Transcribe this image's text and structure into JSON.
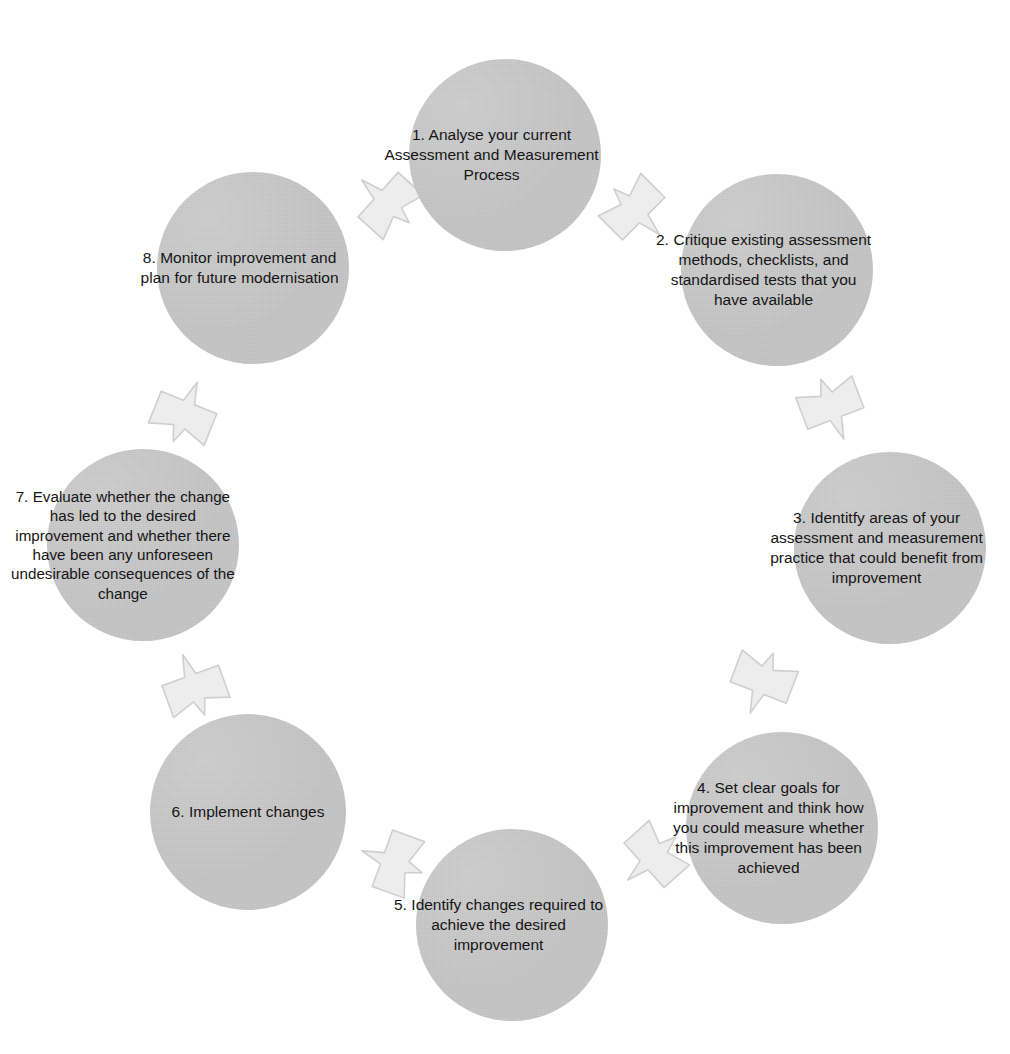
{
  "diagram": {
    "type": "cyclical-process",
    "direction": "clockwise",
    "step_count": 8,
    "colors": {
      "circle_fill": "#c6c6c6",
      "arrow_fill": "#ededed",
      "arrow_stroke": "#c9c9c9",
      "text": "#151515",
      "background": "#ffffff"
    },
    "steps": [
      {
        "number": "1",
        "label": "1. Analyse your current Assessment and Measurement Process",
        "position": {
          "x": 505,
          "y": 155
        },
        "diameter": 192
      },
      {
        "number": "2",
        "label": "2. Critique existing assessment methods, checklists, and standardised tests that you have available",
        "position": {
          "x": 777,
          "y": 270
        },
        "diameter": 192
      },
      {
        "number": "3",
        "label": "3. Identitfy areas of your assessment and measurement practice that could benefit from improvement",
        "position": {
          "x": 890,
          "y": 548
        },
        "diameter": 192
      },
      {
        "number": "4",
        "label": "4. Set clear goals for improvement and think how you could measure whether this improvement has been achieved",
        "position": {
          "x": 782,
          "y": 828
        },
        "diameter": 192
      },
      {
        "number": "5",
        "label": "5. Identify changes required to achieve the desired improvement",
        "position": {
          "x": 512,
          "y": 925
        },
        "diameter": 192
      },
      {
        "number": "6",
        "label": "6. Implement changes",
        "position": {
          "x": 248,
          "y": 812
        },
        "diameter": 196
      },
      {
        "number": "7",
        "label": "7. Evaluate whether the change has led to the desired improvement and whether there have been any unforeseen undesirable consequences of the change",
        "position": {
          "x": 143,
          "y": 545
        },
        "diameter": 192
      },
      {
        "number": "8",
        "label": "8. Monitor improvement and plan for future modernisation",
        "position": {
          "x": 253,
          "y": 268
        },
        "diameter": 192
      }
    ],
    "arrows": [
      {
        "name": "arrow-step-8-to-step-1",
        "from": "8",
        "to": "1",
        "x": 384,
        "y": 200,
        "rotation": -48
      },
      {
        "name": "arrow-step-1-to-step-2",
        "from": "1",
        "to": "2",
        "x": 638,
        "y": 213,
        "rotation": 135
      },
      {
        "name": "arrow-step-2-to-step-3",
        "from": "2",
        "to": "3",
        "x": 833,
        "y": 411,
        "rotation": 159
      },
      {
        "name": "arrow-step-3-to-step-4",
        "from": "3",
        "to": "4",
        "x": 761,
        "y": 685,
        "rotation": 201
      },
      {
        "name": "arrow-step-4-to-step-5",
        "from": "4",
        "to": "5",
        "x": 650,
        "y": 860,
        "rotation": 228
      },
      {
        "name": "arrow-step-5-to-step-6",
        "from": "5",
        "to": "6",
        "x": 390,
        "y": 861,
        "rotation": 290
      },
      {
        "name": "arrow-step-6-to-step-7",
        "from": "6",
        "to": "7",
        "x": 193,
        "y": 683,
        "rotation": 340
      },
      {
        "name": "arrow-step-7-to-step-8",
        "from": "7",
        "to": "8",
        "x": 186,
        "y": 410,
        "rotation": 22
      }
    ]
  }
}
